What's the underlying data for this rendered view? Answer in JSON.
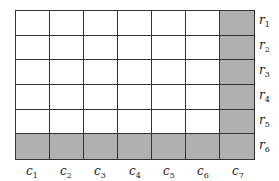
{
  "diagram": {
    "rows": 6,
    "cols": 7,
    "shaded_color": "#b0b0b0",
    "grid_line_color": "#333333",
    "shaded_cells": "last column (c7) and last row (r6)",
    "row_labels": [
      {
        "base": "r",
        "sub": "1"
      },
      {
        "base": "r",
        "sub": "2"
      },
      {
        "base": "r",
        "sub": "3"
      },
      {
        "base": "r",
        "sub": "4"
      },
      {
        "base": "r",
        "sub": "5"
      },
      {
        "base": "r",
        "sub": "6"
      }
    ],
    "col_labels": [
      {
        "base": "c",
        "sub": "1"
      },
      {
        "base": "c",
        "sub": "2"
      },
      {
        "base": "c",
        "sub": "3"
      },
      {
        "base": "c",
        "sub": "4"
      },
      {
        "base": "c",
        "sub": "5"
      },
      {
        "base": "c",
        "sub": "6"
      },
      {
        "base": "c",
        "sub": "7"
      }
    ]
  }
}
